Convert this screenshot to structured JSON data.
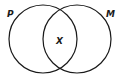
{
  "diagram": {
    "type": "venn",
    "sets": [
      {
        "label": "P",
        "cx": 43,
        "cy": 39,
        "r": 34
      },
      {
        "label": "M",
        "cx": 77,
        "cy": 39,
        "r": 34
      }
    ],
    "intersection_label": "X",
    "stroke_color": "#1a1a1a",
    "background": "#ffffff"
  }
}
